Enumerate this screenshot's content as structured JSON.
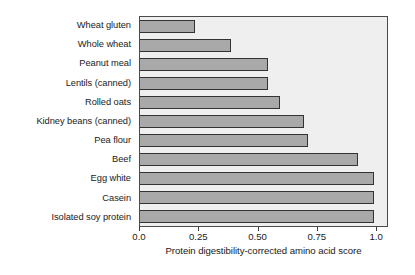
{
  "chart_data": {
    "type": "bar",
    "orientation": "horizontal",
    "title": "",
    "xlabel": "Protein digestibility-corrected amino acid score",
    "ylabel": "",
    "categories": [
      "Wheat gluten",
      "Whole wheat",
      "Peanut meal",
      "Lentils (canned)",
      "Rolled oats",
      "Kidney beans (canned)",
      "Pea flour",
      "Beef",
      "Egg white",
      "Casein",
      "Isolated soy protein"
    ],
    "values": [
      0.24,
      0.39,
      0.55,
      0.55,
      0.6,
      0.7,
      0.72,
      0.93,
      1.0,
      1.0,
      1.0
    ],
    "xlim": [
      0.0,
      1.05
    ],
    "xticks": [
      0.0,
      0.25,
      0.5,
      0.75,
      1.0
    ],
    "xticklabels": [
      "0.0",
      "0.25",
      "0.50",
      "0.75",
      "1.0"
    ],
    "grid": false,
    "legend": null,
    "colors": {
      "bar_fill": "#a9a9a9",
      "bar_edge": "#333333",
      "plot_background": "#efefef",
      "frame": "#4a4a4a",
      "text": "#1a1a1a",
      "figure_background": "#ffffff"
    }
  }
}
